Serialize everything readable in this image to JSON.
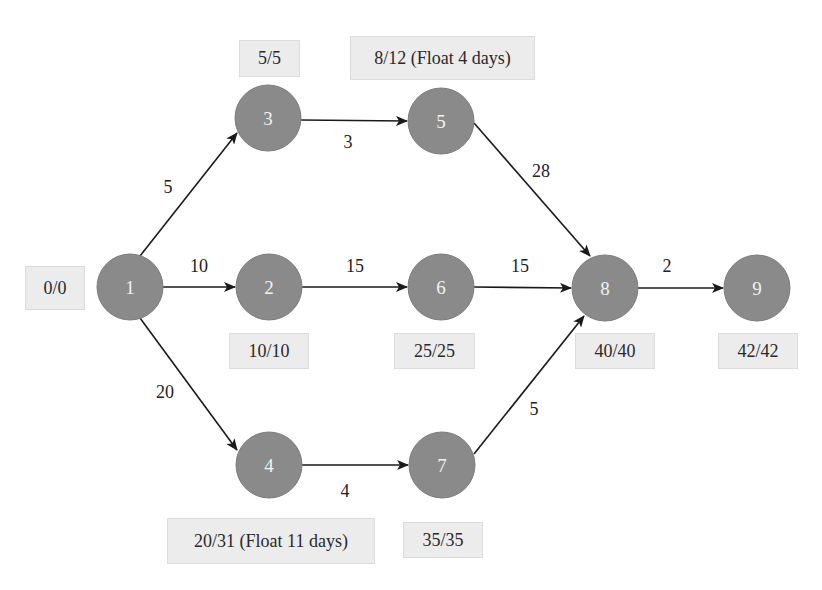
{
  "diagram": {
    "type": "network-diagram",
    "nodes": [
      {
        "id": "1",
        "label": "1",
        "cx": 130,
        "cy": 287,
        "times": "0/0"
      },
      {
        "id": "2",
        "label": "2",
        "cx": 269,
        "cy": 287,
        "times": "10/10"
      },
      {
        "id": "3",
        "label": "3",
        "cx": 268,
        "cy": 118,
        "times": "5/5"
      },
      {
        "id": "4",
        "label": "4",
        "cx": 269,
        "cy": 465,
        "times": "20/31 (Float 11 days)"
      },
      {
        "id": "5",
        "label": "5",
        "cx": 441,
        "cy": 121,
        "times": "8/12 (Float 4 days)"
      },
      {
        "id": "6",
        "label": "6",
        "cx": 441,
        "cy": 287,
        "times": "25/25"
      },
      {
        "id": "7",
        "label": "7",
        "cx": 442,
        "cy": 465,
        "times": "35/35"
      },
      {
        "id": "8",
        "label": "8",
        "cx": 605,
        "cy": 288,
        "times": "40/40"
      },
      {
        "id": "9",
        "label": "9",
        "cx": 757,
        "cy": 288,
        "times": "42/42"
      }
    ],
    "edges": [
      {
        "from": "1",
        "to": "3",
        "duration": "5"
      },
      {
        "from": "1",
        "to": "2",
        "duration": "10"
      },
      {
        "from": "1",
        "to": "4",
        "duration": "20"
      },
      {
        "from": "3",
        "to": "5",
        "duration": "3"
      },
      {
        "from": "2",
        "to": "6",
        "duration": "15"
      },
      {
        "from": "4",
        "to": "7",
        "duration": "4"
      },
      {
        "from": "5",
        "to": "8",
        "duration": "28"
      },
      {
        "from": "6",
        "to": "8",
        "duration": "15"
      },
      {
        "from": "7",
        "to": "8",
        "duration": "5"
      },
      {
        "from": "8",
        "to": "9",
        "duration": "2"
      }
    ],
    "colors": {
      "node_fill": "#8a8a8a",
      "node_text": "#f2f2f2",
      "edge": "#1a1a1a",
      "box_fill": "#ececec"
    }
  }
}
